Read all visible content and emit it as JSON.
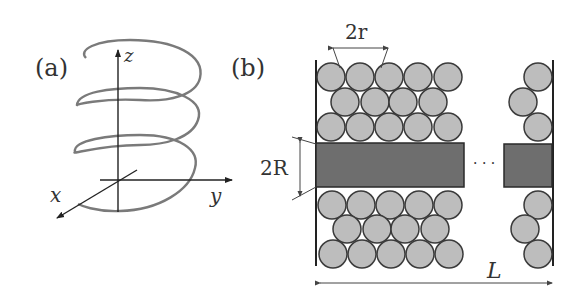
{
  "panels": {
    "a": {
      "label": "(a)",
      "axes": {
        "x": "x",
        "y": "y",
        "z": "z"
      },
      "description": "helix around z axis"
    },
    "b": {
      "label": "(b)",
      "dims": {
        "particle_diameter": "2r",
        "rod_diameter": "2R",
        "length": "L"
      },
      "ellipsis": "· · ·"
    }
  },
  "colors": {
    "helix": "#777777",
    "particle_fill": "#bdbdbd",
    "particle_stroke": "#3a3a3a",
    "rod_fill": "#6e6e6e",
    "line": "#222222"
  }
}
